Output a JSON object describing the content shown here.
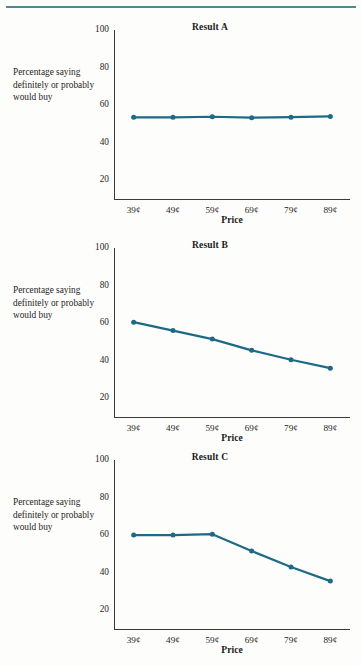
{
  "document": {
    "rule_color": "#4b8a93",
    "series_color": "#1e6a86"
  },
  "y_axis_label": "Percentage saying definitely or probably would buy",
  "x_axis_title": "Price",
  "y_ticks": [
    "100",
    "80",
    "60",
    "40",
    "20"
  ],
  "x_ticks": [
    "39¢",
    "49¢",
    "59¢",
    "69¢",
    "79¢",
    "89¢"
  ],
  "charts": [
    {
      "title": "Result A",
      "values": [
        53.5,
        53.5,
        53.8,
        53.3,
        53.6,
        54.0
      ]
    },
    {
      "title": "Result B",
      "values": [
        60.5,
        56.0,
        51.5,
        45.5,
        40.5,
        36.0
      ]
    },
    {
      "title": "Result C",
      "values": [
        60.0,
        60.0,
        60.5,
        51.5,
        43.0,
        35.5
      ]
    }
  ],
  "chart_data": [
    {
      "type": "line",
      "title": "Result A",
      "xlabel": "Price",
      "ylabel": "Percentage saying definitely or probably would buy",
      "categories": [
        "39¢",
        "49¢",
        "59¢",
        "69¢",
        "79¢",
        "89¢"
      ],
      "values": [
        53.5,
        53.5,
        53.8,
        53.3,
        53.6,
        54.0
      ],
      "ylim": [
        10,
        100
      ],
      "yticks": [
        20,
        40,
        60,
        80,
        100
      ],
      "grid": false,
      "legend": "none",
      "markers": true
    },
    {
      "type": "line",
      "title": "Result B",
      "xlabel": "Price",
      "ylabel": "Percentage saying definitely or probably would buy",
      "categories": [
        "39¢",
        "49¢",
        "59¢",
        "69¢",
        "79¢",
        "89¢"
      ],
      "values": [
        60.5,
        56.0,
        51.5,
        45.5,
        40.5,
        36.0
      ],
      "ylim": [
        10,
        100
      ],
      "yticks": [
        20,
        40,
        60,
        80,
        100
      ],
      "grid": false,
      "legend": "none",
      "markers": true
    },
    {
      "type": "line",
      "title": "Result C",
      "xlabel": "Price",
      "ylabel": "Percentage saying definitely or probably would buy",
      "categories": [
        "39¢",
        "49¢",
        "59¢",
        "69¢",
        "79¢",
        "89¢"
      ],
      "values": [
        60.0,
        60.0,
        60.5,
        51.5,
        43.0,
        35.5
      ],
      "ylim": [
        10,
        100
      ],
      "yticks": [
        20,
        40,
        60,
        80,
        100
      ],
      "grid": false,
      "legend": "none",
      "markers": true
    }
  ]
}
